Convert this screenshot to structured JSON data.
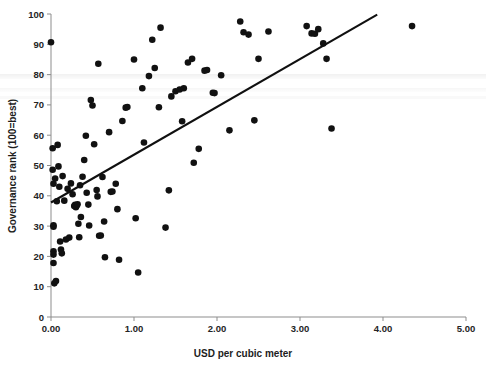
{
  "chart_data": {
    "type": "scatter",
    "title": "",
    "xlabel": "USD per cubic meter",
    "ylabel": "Governance rank (100=best)",
    "xlim": [
      0.0,
      5.0
    ],
    "ylim": [
      0,
      100
    ],
    "xticks": [
      0.0,
      1.0,
      2.0,
      3.0,
      4.0,
      5.0
    ],
    "xtick_labels": [
      "0.00",
      "1.00",
      "2.00",
      "3.00",
      "4.00",
      "5.00"
    ],
    "yticks": [
      0,
      10,
      20,
      30,
      40,
      50,
      60,
      70,
      80,
      90,
      100
    ],
    "ytick_labels": [
      "0",
      "10",
      "20",
      "30",
      "40",
      "50",
      "60",
      "70",
      "80",
      "90",
      "100"
    ],
    "grid": false,
    "legend": null,
    "marker": {
      "shape": "circle",
      "color": "#111111",
      "size": 4.6
    },
    "points": [
      [
        0.0,
        90.7
      ],
      [
        0.02,
        55.7
      ],
      [
        0.02,
        48.6
      ],
      [
        0.03,
        44.0
      ],
      [
        0.03,
        30.3
      ],
      [
        0.03,
        29.8
      ],
      [
        0.03,
        21.7
      ],
      [
        0.03,
        20.6
      ],
      [
        0.03,
        17.8
      ],
      [
        0.04,
        11.1
      ],
      [
        0.05,
        45.7
      ],
      [
        0.06,
        11.9
      ],
      [
        0.07,
        38.2
      ],
      [
        0.08,
        56.8
      ],
      [
        0.09,
        49.7
      ],
      [
        0.1,
        43.0
      ],
      [
        0.11,
        24.9
      ],
      [
        0.12,
        22.3
      ],
      [
        0.13,
        21.0
      ],
      [
        0.14,
        46.5
      ],
      [
        0.16,
        38.4
      ],
      [
        0.18,
        25.6
      ],
      [
        0.2,
        42.3
      ],
      [
        0.22,
        26.2
      ],
      [
        0.24,
        44.1
      ],
      [
        0.26,
        40.5
      ],
      [
        0.28,
        36.6
      ],
      [
        0.29,
        37.0
      ],
      [
        0.3,
        36.2
      ],
      [
        0.31,
        36.8
      ],
      [
        0.32,
        37.2
      ],
      [
        0.33,
        30.8
      ],
      [
        0.34,
        26.3
      ],
      [
        0.35,
        43.5
      ],
      [
        0.36,
        33.0
      ],
      [
        0.38,
        46.3
      ],
      [
        0.4,
        51.8
      ],
      [
        0.42,
        59.8
      ],
      [
        0.43,
        41.0
      ],
      [
        0.45,
        37.1
      ],
      [
        0.46,
        30.2
      ],
      [
        0.48,
        71.6
      ],
      [
        0.5,
        69.8
      ],
      [
        0.52,
        57.0
      ],
      [
        0.55,
        41.9
      ],
      [
        0.56,
        39.8
      ],
      [
        0.57,
        83.6
      ],
      [
        0.58,
        26.8
      ],
      [
        0.6,
        26.9
      ],
      [
        0.62,
        46.2
      ],
      [
        0.64,
        31.5
      ],
      [
        0.65,
        19.7
      ],
      [
        0.7,
        61.0
      ],
      [
        0.72,
        41.3
      ],
      [
        0.74,
        41.4
      ],
      [
        0.78,
        44.0
      ],
      [
        0.8,
        35.6
      ],
      [
        0.82,
        18.9
      ],
      [
        0.86,
        64.7
      ],
      [
        0.9,
        69.1
      ],
      [
        0.92,
        69.3
      ],
      [
        1.0,
        85.0
      ],
      [
        1.02,
        32.6
      ],
      [
        1.05,
        14.7
      ],
      [
        1.1,
        75.5
      ],
      [
        1.12,
        57.6
      ],
      [
        1.18,
        79.5
      ],
      [
        1.22,
        91.5
      ],
      [
        1.25,
        82.2
      ],
      [
        1.3,
        69.2
      ],
      [
        1.32,
        95.5
      ],
      [
        1.38,
        29.5
      ],
      [
        1.42,
        41.8
      ],
      [
        1.45,
        72.8
      ],
      [
        1.5,
        74.5
      ],
      [
        1.55,
        75.1
      ],
      [
        1.58,
        64.6
      ],
      [
        1.6,
        75.5
      ],
      [
        1.65,
        84.0
      ],
      [
        1.7,
        85.2
      ],
      [
        1.72,
        50.9
      ],
      [
        1.78,
        55.5
      ],
      [
        1.85,
        81.3
      ],
      [
        1.88,
        81.5
      ],
      [
        1.95,
        74.0
      ],
      [
        1.97,
        73.9
      ],
      [
        2.05,
        79.8
      ],
      [
        2.15,
        61.6
      ],
      [
        2.28,
        97.5
      ],
      [
        2.32,
        94.0
      ],
      [
        2.38,
        93.2
      ],
      [
        2.45,
        64.9
      ],
      [
        2.5,
        85.2
      ],
      [
        2.62,
        94.2
      ],
      [
        3.08,
        96.0
      ],
      [
        3.14,
        93.6
      ],
      [
        3.18,
        93.5
      ],
      [
        3.22,
        95.0
      ],
      [
        3.28,
        90.3
      ],
      [
        3.32,
        85.2
      ],
      [
        3.38,
        62.2
      ],
      [
        4.35,
        96.0
      ]
    ],
    "trendline": {
      "type": "linear",
      "x_start": 0.0,
      "y_start": 37.8,
      "x_end": 3.93,
      "y_end": 99.8,
      "color": "#101010"
    }
  }
}
